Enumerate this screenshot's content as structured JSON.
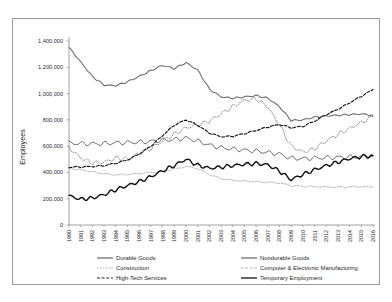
{
  "chart_data": {
    "type": "line",
    "title": "",
    "xlabel": "",
    "ylabel": "Employees",
    "ylim": [
      0,
      1400000
    ],
    "ytick_labels": [
      "0",
      "200,000",
      "400,000",
      "600,000",
      "800,000",
      "1,000,000",
      "1,200,000",
      "1,400,000"
    ],
    "ytick_values": [
      0,
      200000,
      400000,
      600000,
      800000,
      1000000,
      1200000,
      1400000
    ],
    "grid": false,
    "legend_position": "bottom",
    "categories": [
      "1990",
      "1991",
      "1992",
      "1993",
      "1994",
      "1995",
      "1996",
      "1997",
      "1998",
      "1999",
      "2000",
      "2001",
      "2002",
      "2003",
      "2004",
      "2005",
      "2006",
      "2007",
      "2008",
      "2009",
      "2010",
      "2011",
      "2012",
      "2013",
      "2014",
      "2015",
      "2016"
    ],
    "series": [
      {
        "name": "Durable Goods",
        "style": "solid",
        "color": "#6f6f6f",
        "width": 1.1,
        "values": [
          1350000,
          1240000,
          1130000,
          1065000,
          1060000,
          1090000,
          1130000,
          1175000,
          1215000,
          1190000,
          1235000,
          1180000,
          1035000,
          975000,
          965000,
          975000,
          985000,
          965000,
          900000,
          795000,
          800000,
          820000,
          830000,
          835000,
          840000,
          845000,
          835000
        ]
      },
      {
        "name": "Nondurable Goods",
        "style": "solid",
        "color": "#6f6f6f",
        "width": 1.0,
        "values": [
          622000,
          620000,
          618000,
          620000,
          625000,
          628000,
          630000,
          636000,
          645000,
          650000,
          662000,
          640000,
          608000,
          588000,
          578000,
          570000,
          562000,
          552000,
          540000,
          508000,
          505000,
          510000,
          512000,
          515000,
          518000,
          520000,
          520000
        ]
      },
      {
        "name": "Construction",
        "style": "dotted",
        "color": "#8a8a8a",
        "width": 1.0,
        "values": [
          590000,
          510000,
          472000,
          478000,
          510000,
          500000,
          545000,
          580000,
          640000,
          690000,
          740000,
          760000,
          790000,
          845000,
          900000,
          950000,
          960000,
          900000,
          760000,
          600000,
          555000,
          580000,
          640000,
          690000,
          735000,
          780000,
          825000
        ]
      },
      {
        "name": "Computer & Electronic Manufacturing",
        "style": "dashed-light",
        "color": "#a9a9a9",
        "width": 0.9,
        "values": [
          432000,
          420000,
          405000,
          390000,
          382000,
          385000,
          392000,
          400000,
          410000,
          425000,
          445000,
          430000,
          385000,
          352000,
          340000,
          335000,
          330000,
          325000,
          320000,
          300000,
          293000,
          292000,
          290000,
          288000,
          290000,
          292000,
          290000
        ]
      },
      {
        "name": "High-Tech Services",
        "style": "dashed",
        "color": "#1c1c1c",
        "width": 1.2,
        "values": [
          440000,
          442000,
          445000,
          452000,
          470000,
          495000,
          540000,
          600000,
          680000,
          760000,
          800000,
          760000,
          700000,
          672000,
          675000,
          695000,
          720000,
          745000,
          765000,
          740000,
          750000,
          790000,
          840000,
          880000,
          930000,
          980000,
          1030000
        ]
      },
      {
        "name": "Temporary Employment",
        "style": "solid",
        "color": "#111111",
        "width": 1.4,
        "values": [
          222000,
          196000,
          205000,
          232000,
          268000,
          300000,
          330000,
          368000,
          412000,
          452000,
          500000,
          455000,
          432000,
          440000,
          452000,
          462000,
          468000,
          458000,
          410000,
          345000,
          385000,
          420000,
          452000,
          478000,
          505000,
          520000,
          530000
        ]
      }
    ],
    "legend": [
      {
        "label": "Durable Goods",
        "style": "solid",
        "color": "#6f6f6f"
      },
      {
        "label": "Nondurable Goods",
        "style": "solid",
        "color": "#6f6f6f"
      },
      {
        "label": "Construction",
        "style": "dotted",
        "color": "#8a8a8a"
      },
      {
        "label": "Computer & Electronic Manufacturing",
        "style": "dashed-light",
        "color": "#a9a9a9"
      },
      {
        "label": "High-Tech Services",
        "style": "dashed",
        "color": "#1c1c1c"
      },
      {
        "label": "Temporary Employment",
        "style": "solid",
        "color": "#111111"
      }
    ]
  }
}
